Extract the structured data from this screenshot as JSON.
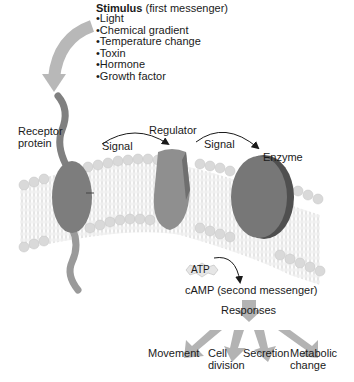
{
  "stimulus": {
    "title_bold": "Stimulus",
    "title_rest": " (first messenger)",
    "items": [
      "Light",
      "Chemical gradient",
      "Temperature change",
      "Toxin",
      "Hormone",
      "Growth factor"
    ]
  },
  "labels": {
    "receptor_line1": "Receptor",
    "receptor_line2": "protein",
    "regulator": "Regulator",
    "enzyme": "Enzyme",
    "signal_1": "Signal",
    "signal_2": "Signal",
    "atp": "ATP",
    "camp": "cAMP (second messenger)",
    "responses": "Responses"
  },
  "responses": [
    {
      "line1": "Movement",
      "line2": ""
    },
    {
      "line1": "Cell",
      "line2": "division"
    },
    {
      "line1": "Secretion",
      "line2": ""
    },
    {
      "line1": "Metabolic",
      "line2": "change"
    }
  ],
  "colors": {
    "arrow_gray": "#b3b3b3",
    "protein_dark": "#7a7a7a",
    "protein_light": "#9a9a9a",
    "membrane_head": "#d8d8d8",
    "membrane_tail": "#f0f0f0",
    "text": "#1a1a1a"
  }
}
